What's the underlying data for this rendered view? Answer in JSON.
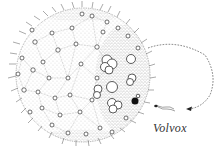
{
  "figure": {
    "label": "Volvox",
    "colors": {
      "ink": "#333333",
      "stipple": "#555555",
      "background": "#ffffff"
    },
    "parts": [
      "spherical colony",
      "somatic cells connected by cytoplasmic strands",
      "flagella",
      "daughter colonies",
      "dark reproductive cell",
      "single flagellated cell",
      "dashed arrow"
    ]
  }
}
